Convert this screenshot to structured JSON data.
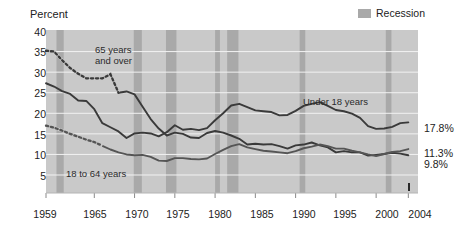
{
  "chart_data": {
    "type": "line",
    "title": "",
    "ylabel": "Percent",
    "xlabel": "",
    "ylim": [
      3,
      40
    ],
    "xlim": [
      1959,
      2005.2
    ],
    "yticks": [
      40,
      35,
      30,
      25,
      20,
      15,
      10,
      5
    ],
    "xticks": [
      1959,
      1965,
      1970,
      1975,
      1980,
      1985,
      1990,
      1995,
      2000,
      2004
    ],
    "grid": "horizontal",
    "legend_position": "top-right",
    "plot_background": "#c9c9c9",
    "legend": [
      {
        "label": "Recession",
        "color": "#a9a9a9",
        "type": "band"
      }
    ],
    "series": [
      {
        "name": "65 years and over",
        "style": "dotted",
        "color": "#3a3a3a",
        "end_label": "9.8%",
        "x": [
          1959,
          1960,
          1961,
          1962,
          1963,
          1964,
          1965,
          1966,
          1967,
          1968,
          1969,
          1970,
          1971,
          1972,
          1973,
          1974,
          1975,
          1976,
          1977,
          1978,
          1979,
          1980,
          1981,
          1982,
          1983,
          1984,
          1985,
          1986,
          1987,
          1988,
          1989,
          1990,
          1991,
          1992,
          1993,
          1994,
          1995,
          1996,
          1997,
          1998,
          1999,
          2000,
          2001,
          2002,
          2003,
          2004
        ],
        "y": [
          35.2,
          35.0,
          32.9,
          31.0,
          29.6,
          28.5,
          28.5,
          28.5,
          29.5,
          25.0,
          25.3,
          24.6,
          21.6,
          18.6,
          16.3,
          14.6,
          15.3,
          15.0,
          14.1,
          14.0,
          15.2,
          15.7,
          15.3,
          14.6,
          13.8,
          12.4,
          12.6,
          12.4,
          12.5,
          12.0,
          11.4,
          12.2,
          12.4,
          12.9,
          12.2,
          11.7,
          10.5,
          10.8,
          10.5,
          10.5,
          9.7,
          9.9,
          10.1,
          10.4,
          10.2,
          9.8
        ]
      },
      {
        "name": "Under 18 years",
        "style": "solid",
        "color": "#3a3a3a",
        "end_label": "17.8%",
        "x": [
          1959,
          1960,
          1961,
          1962,
          1963,
          1964,
          1965,
          1966,
          1967,
          1968,
          1969,
          1970,
          1971,
          1972,
          1973,
          1974,
          1975,
          1976,
          1977,
          1978,
          1979,
          1980,
          1981,
          1982,
          1983,
          1984,
          1985,
          1986,
          1987,
          1988,
          1989,
          1990,
          1991,
          1992,
          1993,
          1994,
          1995,
          1996,
          1997,
          1998,
          1999,
          2000,
          2001,
          2002,
          2003,
          2004
        ],
        "y": [
          27.3,
          26.5,
          25.4,
          24.7,
          23.1,
          23.0,
          21.0,
          17.6,
          16.6,
          15.6,
          14.0,
          15.1,
          15.3,
          15.1,
          14.4,
          15.4,
          17.1,
          16.0,
          16.2,
          15.9,
          16.4,
          18.3,
          20.0,
          21.9,
          22.3,
          21.5,
          20.7,
          20.5,
          20.3,
          19.5,
          19.6,
          20.6,
          21.8,
          22.3,
          22.7,
          21.8,
          20.8,
          20.5,
          19.9,
          18.9,
          16.9,
          16.2,
          16.3,
          16.7,
          17.6,
          17.8
        ]
      },
      {
        "name": "18 to 64 years",
        "style": "dotted",
        "color": "#555555",
        "end_label": "11.3%",
        "x": [
          1959,
          1960,
          1961,
          1962,
          1963,
          1964,
          1965,
          1966,
          1967,
          1968,
          1969,
          1970,
          1971,
          1972,
          1973,
          1974,
          1975,
          1976,
          1977,
          1978,
          1979,
          1980,
          1981,
          1982,
          1983,
          1984,
          1985,
          1986,
          1987,
          1988,
          1989,
          1990,
          1991,
          1992,
          1993,
          1994,
          1995,
          1996,
          1997,
          1998,
          1999,
          2000,
          2001,
          2002,
          2003,
          2004
        ],
        "y": [
          17.0,
          16.5,
          15.8,
          15.0,
          14.3,
          13.6,
          13.0,
          12.1,
          11.2,
          10.5,
          10.0,
          9.8,
          9.9,
          9.4,
          8.5,
          8.4,
          9.1,
          9.1,
          8.9,
          8.8,
          9.0,
          10.1,
          11.1,
          12.0,
          12.5,
          11.7,
          11.3,
          10.9,
          10.7,
          10.5,
          10.3,
          10.8,
          11.5,
          11.9,
          12.4,
          12.0,
          11.4,
          11.4,
          10.9,
          10.5,
          10.0,
          9.6,
          10.1,
          10.6,
          10.8,
          11.3
        ]
      }
    ],
    "annotations": [
      {
        "text": "65 years",
        "x_px": 95,
        "y_px": 48
      },
      {
        "text": "and over",
        "x_px": 95,
        "y_px": 59
      },
      {
        "text": "Under 18 years",
        "x_px": 305,
        "y_px": 100
      },
      {
        "text": "18 to 64 years",
        "x_px": 66,
        "y_px": 172
      }
    ],
    "recession_bands": [
      {
        "start": 1960.3,
        "end": 1961.2
      },
      {
        "start": 1969.9,
        "end": 1970.9
      },
      {
        "start": 1973.9,
        "end": 1975.2
      },
      {
        "start": 1980.0,
        "end": 1980.6
      },
      {
        "start": 1981.5,
        "end": 1982.9
      },
      {
        "start": 1990.5,
        "end": 1991.2
      },
      {
        "start": 2001.2,
        "end": 2001.9
      }
    ]
  },
  "labels": {
    "y_axis_title": "Percent",
    "legend_recession": "Recession",
    "ytick_40": "40",
    "ytick_35": "35",
    "ytick_30": "30",
    "ytick_25": "25",
    "ytick_20": "20",
    "ytick_15": "15",
    "ytick_10": "10",
    "ytick_5": "5",
    "xtick_1959": "1959",
    "xtick_1965": "1965",
    "xtick_1970": "1970",
    "xtick_1975": "1975",
    "xtick_1980": "1980",
    "xtick_1985": "1985",
    "xtick_1990": "1990",
    "xtick_1995": "1995",
    "xtick_2000": "2000",
    "xtick_2004": "2004",
    "end_under18": "17.8%",
    "end_18to64": "11.3%",
    "end_65plus": "9.8%",
    "ann_65a": "65 years",
    "ann_65b": "and over",
    "ann_under18": "Under 18 years",
    "ann_18to64": "18 to 64 years"
  }
}
